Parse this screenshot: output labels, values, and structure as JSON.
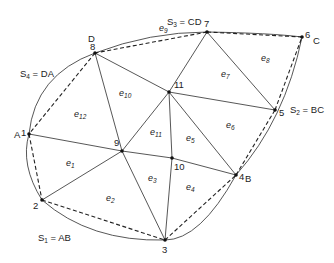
{
  "diagram": {
    "type": "finite-element-mesh",
    "nodes": [
      {
        "id": "1",
        "x": 29,
        "y": 134,
        "corner": "A"
      },
      {
        "id": "2",
        "x": 42,
        "y": 200
      },
      {
        "id": "3",
        "x": 165,
        "y": 240
      },
      {
        "id": "4",
        "x": 236,
        "y": 175,
        "corner": "B"
      },
      {
        "id": "5",
        "x": 275,
        "y": 110
      },
      {
        "id": "6",
        "x": 302,
        "y": 37,
        "corner": "C"
      },
      {
        "id": "7",
        "x": 207,
        "y": 32
      },
      {
        "id": "8",
        "x": 95,
        "y": 53,
        "corner": "D"
      },
      {
        "id": "9",
        "x": 122,
        "y": 151
      },
      {
        "id": "10",
        "x": 172,
        "y": 158
      },
      {
        "id": "11",
        "x": 169,
        "y": 92
      }
    ],
    "elements": [
      {
        "label": "e",
        "sub": "1",
        "x": 66,
        "y": 166
      },
      {
        "label": "e",
        "sub": "2",
        "x": 106,
        "y": 201
      },
      {
        "label": "e",
        "sub": "3",
        "x": 148,
        "y": 181
      },
      {
        "label": "e",
        "sub": "4",
        "x": 186,
        "y": 190
      },
      {
        "label": "e",
        "sub": "5",
        "x": 186,
        "y": 141
      },
      {
        "label": "e",
        "sub": "6",
        "x": 226,
        "y": 128
      },
      {
        "label": "e",
        "sub": "7",
        "x": 221,
        "y": 77
      },
      {
        "label": "e",
        "sub": "8",
        "x": 261,
        "y": 61
      },
      {
        "label": "e",
        "sub": "9",
        "x": 159,
        "y": 31
      },
      {
        "label": "e",
        "sub": "10",
        "x": 119,
        "y": 96
      },
      {
        "label": "e",
        "sub": "11",
        "x": 150,
        "y": 135
      },
      {
        "label": "e",
        "sub": "12",
        "x": 74,
        "y": 117
      }
    ],
    "boundary_labels": [
      {
        "text": "S",
        "sub": "1",
        "rest": " = AB",
        "x": 38,
        "y": 241
      },
      {
        "text": "S",
        "sub": "2",
        "rest": " = BC",
        "x": 290,
        "y": 113
      },
      {
        "text": "S",
        "sub": "3",
        "rest": " = CD",
        "x": 167,
        "y": 25
      },
      {
        "text": "S",
        "sub": "4",
        "rest": " = DA",
        "x": 20,
        "y": 77
      }
    ],
    "corner_labels": [
      {
        "text": "A",
        "x": 14,
        "y": 138
      },
      {
        "text": "B",
        "x": 245,
        "y": 182
      },
      {
        "text": "C",
        "x": 313,
        "y": 44
      },
      {
        "text": "D",
        "x": 88,
        "y": 42
      }
    ]
  }
}
